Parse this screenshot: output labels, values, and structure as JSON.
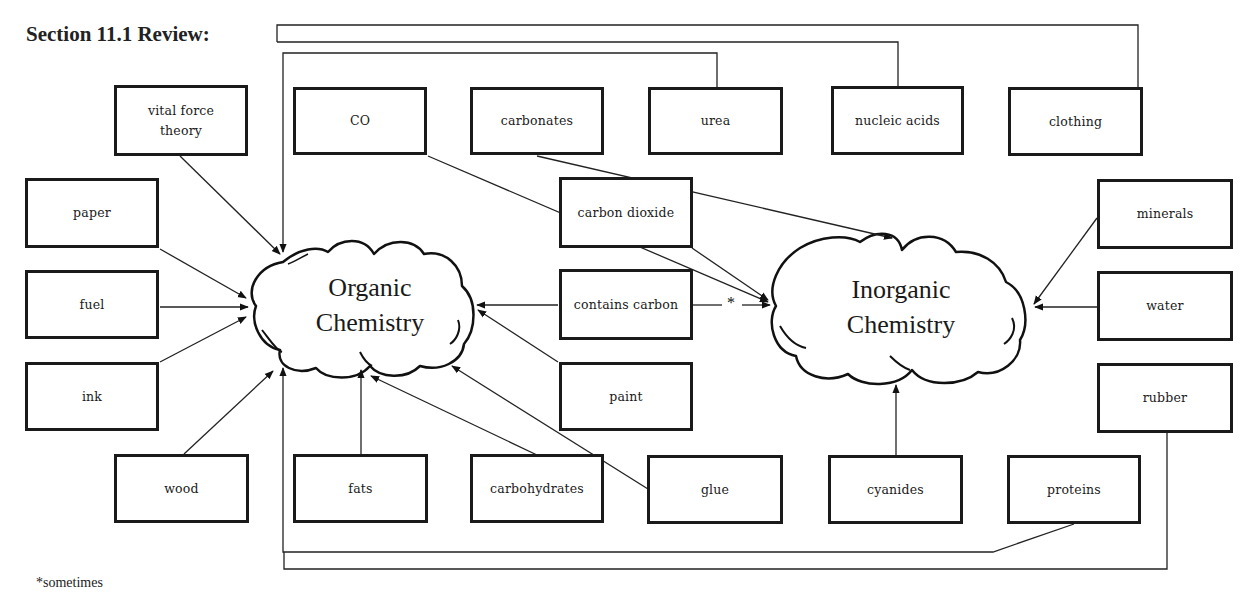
{
  "page": {
    "title": "Section 11.1 Review:",
    "footnote": "*sometimes"
  },
  "diagram": {
    "type": "concept-map",
    "hubs": {
      "organic": {
        "label": "Organic\nChemistry"
      },
      "inorganic": {
        "label": "Inorganic\nChemistry"
      }
    },
    "nodes": {
      "vital_force_theory": "vital force\ntheory",
      "co": "CO",
      "carbonates": "carbonates",
      "urea": "urea",
      "nucleic_acids": "nucleic acids",
      "clothing": "clothing",
      "paper": "paper",
      "fuel": "fuel",
      "ink": "ink",
      "carbon_dioxide": "carbon dioxide",
      "contains_carbon": "contains carbon",
      "paint": "paint",
      "minerals": "minerals",
      "water": "water",
      "rubber": "rubber",
      "wood": "wood",
      "fats": "fats",
      "carbohydrates": "carbohydrates",
      "glue": "glue",
      "cyanides": "cyanides",
      "proteins": "proteins"
    },
    "sometimes_marker": "*",
    "edges": [
      {
        "from": "vital force theory",
        "to": "Organic Chemistry"
      },
      {
        "from": "urea",
        "to": "Organic Chemistry"
      },
      {
        "from": "nucleic acids",
        "to": "Organic Chemistry"
      },
      {
        "from": "clothing",
        "to": "Organic Chemistry"
      },
      {
        "from": "paper",
        "to": "Organic Chemistry"
      },
      {
        "from": "fuel",
        "to": "Organic Chemistry"
      },
      {
        "from": "ink",
        "to": "Organic Chemistry"
      },
      {
        "from": "wood",
        "to": "Organic Chemistry"
      },
      {
        "from": "fats",
        "to": "Organic Chemistry"
      },
      {
        "from": "carbohydrates",
        "to": "Organic Chemistry"
      },
      {
        "from": "glue",
        "to": "Organic Chemistry"
      },
      {
        "from": "paint",
        "to": "Organic Chemistry"
      },
      {
        "from": "contains carbon",
        "to": "Organic Chemistry"
      },
      {
        "from": "proteins",
        "to": "Organic Chemistry"
      },
      {
        "from": "rubber",
        "to": "Organic Chemistry"
      },
      {
        "from": "contains carbon",
        "to": "Inorganic Chemistry",
        "label": "*"
      },
      {
        "from": "CO",
        "to": "Inorganic Chemistry"
      },
      {
        "from": "carbon dioxide",
        "to": "Inorganic Chemistry"
      },
      {
        "from": "carbonates",
        "to": "Inorganic Chemistry"
      },
      {
        "from": "minerals",
        "to": "Inorganic Chemistry"
      },
      {
        "from": "water",
        "to": "Inorganic Chemistry"
      },
      {
        "from": "cyanides",
        "to": "Inorganic Chemistry"
      }
    ]
  }
}
